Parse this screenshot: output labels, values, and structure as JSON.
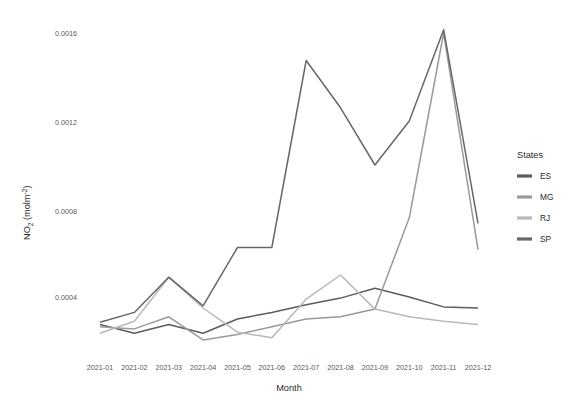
{
  "chart_data": {
    "type": "line",
    "title": "",
    "xlabel": "Month",
    "ylabel": "NO2 (molm-2)",
    "ylabel_display": "NO₂ (molm⁻²)",
    "categories": [
      "2021-01",
      "2021-02",
      "2021-03",
      "2021-04",
      "2021-05",
      "2021-06",
      "2021-07",
      "2021-08",
      "2021-09",
      "2021-10",
      "2021-11",
      "2021-12"
    ],
    "ytick_labels": [
      "0.0004",
      "0.0008",
      "0.0012",
      "0.0016"
    ],
    "ytick_values": [
      0.0004,
      0.0008,
      0.0012,
      0.0016
    ],
    "ylim": [
      0.00012,
      0.0017
    ],
    "grid": false,
    "legend_position": "right",
    "legend_title": "States",
    "series": [
      {
        "name": "ES",
        "color": "#5c5c5c",
        "values": [
          0.000275,
          0.000235,
          0.000275,
          0.000235,
          0.0003,
          0.00033,
          0.000365,
          0.000395,
          0.00044,
          0.0004,
          0.000355,
          0.00035
        ]
      },
      {
        "name": "MG",
        "color": "#999999",
        "values": [
          0.000265,
          0.000255,
          0.00031,
          0.000205,
          0.00023,
          0.000265,
          0.0003,
          0.00031,
          0.000345,
          0.00076,
          0.0016,
          0.000615
        ]
      },
      {
        "name": "RJ",
        "color": "#b8b8b8",
        "values": [
          0.000235,
          0.00029,
          0.00049,
          0.00035,
          0.00024,
          0.000215,
          0.00039,
          0.0005,
          0.000345,
          0.00031,
          0.00029,
          0.000275
        ]
      },
      {
        "name": "SP",
        "color": "#676767",
        "values": [
          0.000285,
          0.00033,
          0.00049,
          0.00036,
          0.000625,
          0.000625,
          0.001475,
          0.00126,
          0.001,
          0.0012,
          0.001615,
          0.000735
        ]
      }
    ]
  },
  "legend": {
    "title": "States",
    "items": [
      {
        "label": "ES",
        "color": "#5c5c5c"
      },
      {
        "label": "MG",
        "color": "#999999"
      },
      {
        "label": "RJ",
        "color": "#b8b8b8"
      },
      {
        "label": "SP",
        "color": "#676767"
      }
    ]
  },
  "axes": {
    "x_title": "Month",
    "y_title_main": "NO",
    "y_title_sub": "2",
    "y_title_unit": " (molm",
    "y_title_sup": "-2",
    "y_title_close": ")"
  }
}
